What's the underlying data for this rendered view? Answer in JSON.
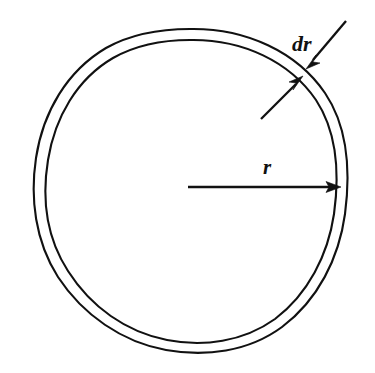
{
  "figure": {
    "background_color": "#ffffff",
    "stroke_color": "#111111",
    "width": 375,
    "height": 373,
    "labels": {
      "radius": "r",
      "thickness": "dr"
    },
    "shapes": {
      "outer_circle": {
        "name": "outer-circle",
        "center_x": 190,
        "center_y": 185,
        "radius": 156
      },
      "inner_circle": {
        "name": "inner-circle",
        "center_x": 190,
        "center_y": 185,
        "radius": 145
      }
    },
    "annotations": {
      "radius_arrow": {
        "name": "radius-arrow",
        "from_x": 188,
        "from_y": 187,
        "to_x": 340,
        "to_y": 187,
        "label": "r",
        "label_x": 265,
        "label_y": 173
      },
      "thickness_label": {
        "name": "thickness-label",
        "label": "dr",
        "label_x": 292,
        "label_y": 50
      },
      "thickness_arrow_upper": {
        "name": "thickness-arrow-upper-right",
        "from_x": 345,
        "from_y": 22,
        "to_x": 307,
        "to_y": 67
      },
      "thickness_arrow_lower": {
        "name": "thickness-arrow-lower-left",
        "from_x": 262,
        "from_y": 118,
        "to_x": 301,
        "to_y": 78
      }
    }
  }
}
